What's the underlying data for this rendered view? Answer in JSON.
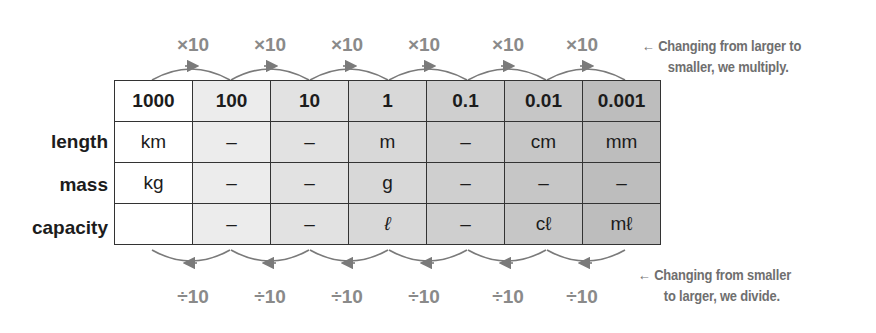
{
  "top_operations": [
    "×10",
    "×10",
    "×10",
    "×10",
    "×10",
    "×10"
  ],
  "bottom_operations": [
    "÷10",
    "÷10",
    "÷10",
    "÷10",
    "÷10",
    "÷10"
  ],
  "top_note": {
    "arrow": "←",
    "line1": "Changing from larger to",
    "line2": "smaller, we multiply."
  },
  "bottom_note": {
    "arrow": "←",
    "line1": "Changing from smaller",
    "line2": "to larger, we divide."
  },
  "table": {
    "headers": [
      "1000",
      "100",
      "10",
      "1",
      "0.1",
      "0.01",
      "0.001"
    ],
    "rows": [
      {
        "label": "length",
        "cells": [
          "km",
          "–",
          "–",
          "m",
          "–",
          "cm",
          "mm"
        ]
      },
      {
        "label": "mass",
        "cells": [
          "kg",
          "–",
          "–",
          "g",
          "–",
          "–",
          "–"
        ]
      },
      {
        "label": "capacity",
        "cells": [
          "",
          "–",
          "–",
          "ℓ",
          "–",
          "cℓ",
          "mℓ"
        ]
      }
    ],
    "column_shades": [
      "#ffffff",
      "#ececec",
      "#e2e2e2",
      "#d8d8d8",
      "#cfcfcf",
      "#c6c6c6",
      "#bdbdbd"
    ]
  }
}
